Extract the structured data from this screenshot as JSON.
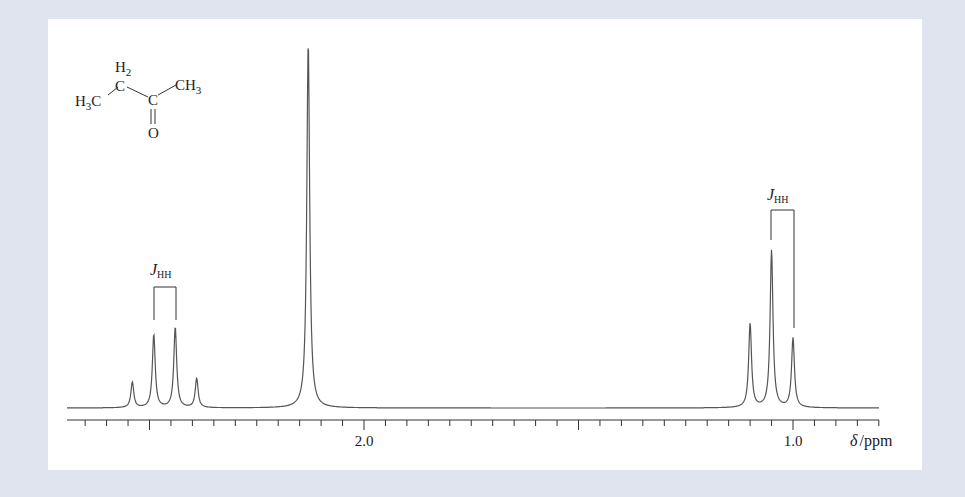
{
  "chart_data": {
    "type": "line",
    "title": "",
    "subtitle": "1H NMR spectrum of butanone",
    "xlabel": "δ /ppm",
    "ylabel": "",
    "x_reversed": true,
    "xlim": [
      2.7,
      0.8
    ],
    "major_ticks": [
      {
        "value": 2.0,
        "label": "2.0"
      },
      {
        "value": 1.0,
        "label": "1.0"
      }
    ],
    "minor_tick_step": 0.05,
    "grid": false,
    "legend": null,
    "peaks": [
      {
        "ppm": 2.54,
        "rel_height": 0.07,
        "group": "CH2 quartet"
      },
      {
        "ppm": 2.49,
        "rel_height": 0.2,
        "group": "CH2 quartet"
      },
      {
        "ppm": 2.44,
        "rel_height": 0.22,
        "group": "CH2 quartet"
      },
      {
        "ppm": 2.39,
        "rel_height": 0.08,
        "group": "CH2 quartet"
      },
      {
        "ppm": 2.13,
        "rel_height": 1.0,
        "group": "CH3 singlet (C(=O)CH3)"
      },
      {
        "ppm": 1.1,
        "rel_height": 0.23,
        "group": "CH3 triplet"
      },
      {
        "ppm": 1.05,
        "rel_height": 0.43,
        "group": "CH3 triplet"
      },
      {
        "ppm": 1.0,
        "rel_height": 0.19,
        "group": "CH3 triplet"
      }
    ],
    "annotations": [
      {
        "text": "J",
        "subscript": "HH",
        "over": "quartet",
        "span_ppm": [
          2.49,
          2.44
        ]
      },
      {
        "text": "J",
        "subscript": "HH",
        "over": "triplet",
        "span_ppm": [
          1.05,
          1.0
        ]
      }
    ]
  },
  "molecule": {
    "h2": "H",
    "h2_sub": "2",
    "c_top": "C",
    "h3c_left": "H",
    "h3c_left_sub": "3",
    "h3c_left_c": "C",
    "c_carbonyl": "C",
    "ch3_right": "CH",
    "ch3_right_sub": "3",
    "oxygen": "O"
  },
  "axis": {
    "label_delta": "δ",
    "label_unit": "/ppm",
    "tick_2": "2.0",
    "tick_1": "1.0"
  },
  "jhh_left": {
    "j": "J",
    "sub": "HH"
  },
  "jhh_right": {
    "j": "J",
    "sub": "HH"
  }
}
